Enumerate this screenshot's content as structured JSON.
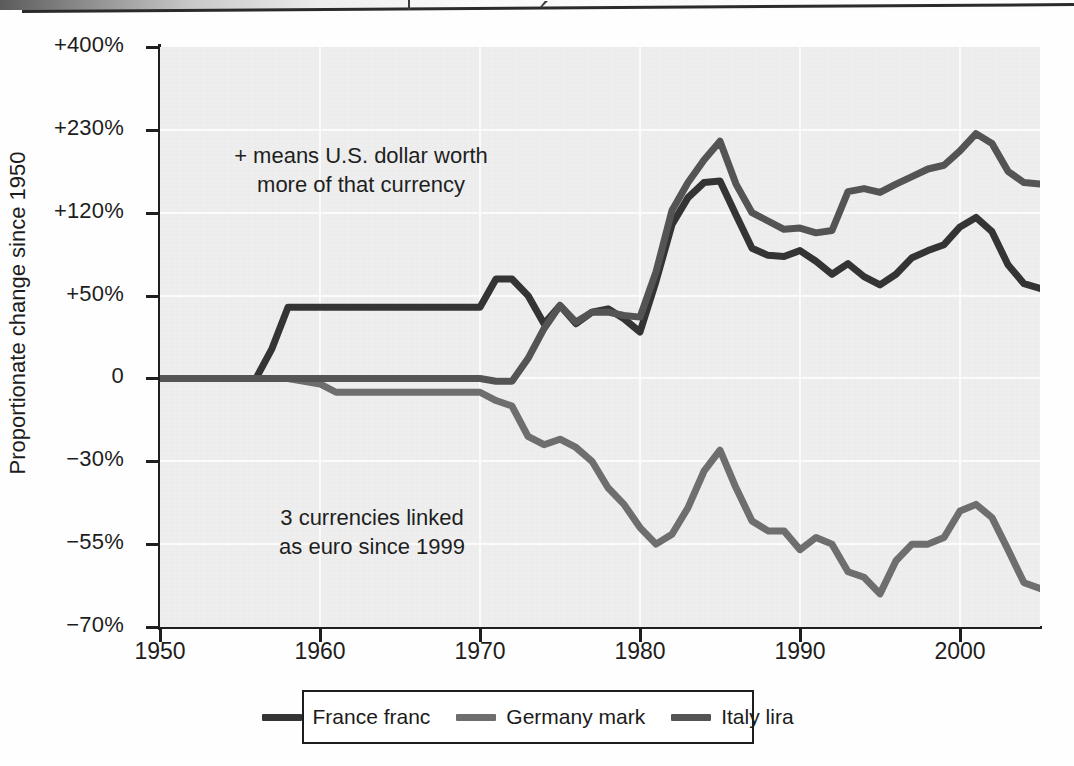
{
  "annotations": {
    "positive": "+ means U.S. dollar worth\nmore of that currency",
    "euro": "3 currencies linked\nas euro since 1999"
  },
  "axis": {
    "y_title": "Proportionate change since 1950",
    "y_ticks": [
      "+400%",
      "+230%",
      "+120%",
      "+50%",
      "0",
      "−30%",
      "−55%",
      "−70%"
    ],
    "x_ticks": [
      "1950",
      "1960",
      "1970",
      "1980",
      "1990",
      "2000"
    ]
  },
  "legend": {
    "items": [
      {
        "label": "France franc",
        "color": "#343434"
      },
      {
        "label": "Germany mark",
        "color": "#6e6e6e"
      },
      {
        "label": "Italy lira",
        "color": "#545454"
      }
    ]
  },
  "chart_data": {
    "type": "line",
    "xlabel": "",
    "ylabel": "Proportionate change since 1950",
    "xlim": [
      1950,
      2005
    ],
    "ylim": [
      -70,
      400
    ],
    "y_tick_values": [
      400,
      230,
      120,
      50,
      0,
      -30,
      -55,
      -70
    ],
    "y_tick_labels": [
      "+400%",
      "+230%",
      "+120%",
      "+50%",
      "0",
      "−30%",
      "−55%",
      "−70%"
    ],
    "y_scale": "nonlinear-piecewise",
    "x_tick_values": [
      1950,
      1960,
      1970,
      1980,
      1990,
      2000
    ],
    "grid": true,
    "legend_position": "bottom",
    "annotations": [
      {
        "text": "+ means U.S. dollar worth more of that currency",
        "x": 1962,
        "y": 175
      },
      {
        "text": "3 currencies linked as euro since 1999",
        "x": 1965,
        "y": -45
      }
    ],
    "x": [
      1950,
      1951,
      1952,
      1953,
      1954,
      1955,
      1956,
      1957,
      1958,
      1959,
      1960,
      1961,
      1962,
      1963,
      1964,
      1965,
      1966,
      1967,
      1968,
      1969,
      1970,
      1971,
      1972,
      1973,
      1974,
      1975,
      1976,
      1977,
      1978,
      1979,
      1980,
      1981,
      1982,
      1983,
      1984,
      1985,
      1986,
      1987,
      1988,
      1989,
      1990,
      1991,
      1992,
      1993,
      1994,
      1995,
      1996,
      1997,
      1998,
      1999,
      2000,
      2001,
      2002,
      2003,
      2004,
      2005
    ],
    "series": [
      {
        "name": "France franc",
        "color": "#343434",
        "values": [
          0,
          0,
          0,
          0,
          0,
          0,
          0,
          18,
          43,
          43,
          43,
          43,
          43,
          43,
          43,
          43,
          43,
          43,
          43,
          43,
          43,
          64,
          64,
          50,
          33,
          44,
          33,
          40,
          42,
          36,
          28,
          62,
          110,
          140,
          160,
          162,
          118,
          90,
          84,
          83,
          88,
          79,
          68,
          77,
          66,
          59,
          68,
          82,
          88,
          93,
          108,
          116,
          104,
          76,
          60,
          56
        ]
      },
      {
        "name": "Germany mark",
        "color": "#6e6e6e",
        "values": [
          0,
          0,
          0,
          0,
          0,
          0,
          0,
          0,
          0,
          -1,
          -2,
          -5,
          -5,
          -5,
          -5,
          -5,
          -5,
          -5,
          -5,
          -5,
          -5,
          -8,
          -10,
          -21,
          -24,
          -22,
          -25,
          -30,
          -38,
          -43,
          -50,
          -55,
          -52,
          -44,
          -33,
          -26,
          -38,
          -48,
          -51,
          -51,
          -56,
          -53,
          -55,
          -60,
          -61,
          -64,
          -58,
          -55,
          -55,
          -53,
          -45,
          -43,
          -47,
          -56,
          -62,
          -63
        ]
      },
      {
        "name": "Italy lira",
        "color": "#545454",
        "values": [
          0,
          0,
          0,
          0,
          0,
          0,
          0,
          0,
          0,
          0,
          0,
          0,
          0,
          0,
          0,
          0,
          0,
          0,
          0,
          0,
          0,
          -1,
          -1,
          12,
          30,
          44,
          34,
          40,
          40,
          38,
          37,
          70,
          123,
          160,
          190,
          215,
          158,
          120,
          113,
          106,
          107,
          103,
          105,
          148,
          152,
          147,
          158,
          168,
          178,
          183,
          202,
          225,
          212,
          175,
          160,
          158
        ]
      }
    ]
  }
}
